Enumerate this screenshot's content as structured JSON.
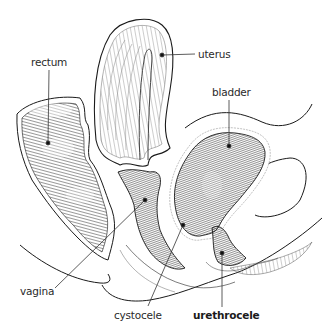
{
  "diagram": {
    "type": "anatomical cross-section illustration",
    "style": {
      "ink": "#1a1a1a",
      "hatch": "#3a3a3a",
      "background": "#ffffff"
    },
    "labels": [
      {
        "id": "rectum",
        "text": "rectum",
        "bold": false,
        "x": 31,
        "y": 56,
        "dot": [
          48,
          143
        ]
      },
      {
        "id": "uterus",
        "text": "uterus",
        "bold": false,
        "x": 198,
        "y": 48,
        "dot": [
          162,
          55
        ]
      },
      {
        "id": "bladder",
        "text": "bladder",
        "bold": false,
        "x": 214,
        "y": 86,
        "dot": [
          229,
          146
        ]
      },
      {
        "id": "vagina",
        "text": "vagina",
        "bold": false,
        "x": 20,
        "y": 285,
        "dot": [
          145,
          200
        ]
      },
      {
        "id": "cystocele",
        "text": "cystocele",
        "bold": false,
        "x": 114,
        "y": 309,
        "dot": [
          183,
          225
        ]
      },
      {
        "id": "urethrocele",
        "text": "urethrocele",
        "bold": true,
        "x": 193,
        "y": 309,
        "dot": [
          222,
          253
        ]
      }
    ]
  }
}
